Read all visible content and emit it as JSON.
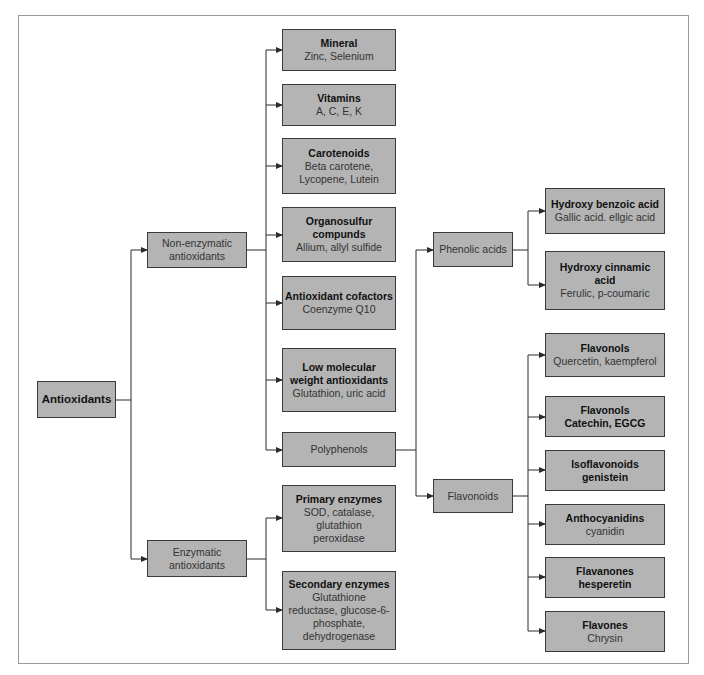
{
  "diagram": {
    "root": {
      "title": "Antioxidants"
    },
    "branches": {
      "non_enzymatic": {
        "label": "Non-enzymatic antioxidants"
      },
      "enzymatic": {
        "label": "Enzymatic antioxidants"
      }
    },
    "non_enzymatic_children": [
      {
        "title": "Mineral",
        "sub": "Zinc, Selenium"
      },
      {
        "title": "Vitamins",
        "sub": "A, C, E, K"
      },
      {
        "title": "Carotenoids",
        "sub": "Beta carotene, Lycopene, Lutein"
      },
      {
        "title": "Organosulfur compunds",
        "sub": "Allium, allyl sulfide"
      },
      {
        "title": "Antioxidant cofactors",
        "sub": "Coenzyme Q10"
      },
      {
        "title": "Low molecular weight antioxidants",
        "sub": "Glutathion, uric acid"
      },
      {
        "title": "",
        "sub": "Polyphenols"
      }
    ],
    "enzymatic_children": [
      {
        "title": "Primary enzymes",
        "sub": "SOD, catalase, glutathion peroxidase"
      },
      {
        "title": "Secondary enzymes",
        "sub": "Glutathione reductase, glucose-6-phosphate, dehydrogenase"
      }
    ],
    "polyphenol_children": {
      "phenolic_acids": {
        "label": "Phenolic acids"
      },
      "flavonoids": {
        "label": "Flavonoids"
      }
    },
    "phenolic_acid_children": [
      {
        "title": "Hydroxy benzoic acid",
        "sub": "Gallic acid. ellgic acid"
      },
      {
        "title": "Hydroxy cinnamic acid",
        "sub": "Ferulic, p-coumaric"
      }
    ],
    "flavonoid_children": [
      {
        "title": "Flavonols",
        "sub": "Quercetin, kaempferol"
      },
      {
        "title": "Flavonols",
        "title2": "Catechin, EGCG"
      },
      {
        "title": "Isoflavonoids",
        "title2": "genistein"
      },
      {
        "title": "Anthocyanidins",
        "sub": "cyanidin"
      },
      {
        "title": "Flavanones",
        "title2": "hesperetin"
      },
      {
        "title": "Flavones",
        "sub": "Chrysin"
      }
    ]
  },
  "colors": {
    "box_fill": "#b4b4b4",
    "box_border": "#3a3a3a",
    "line": "#2b2b2b",
    "frame": "#9a9a9a"
  }
}
